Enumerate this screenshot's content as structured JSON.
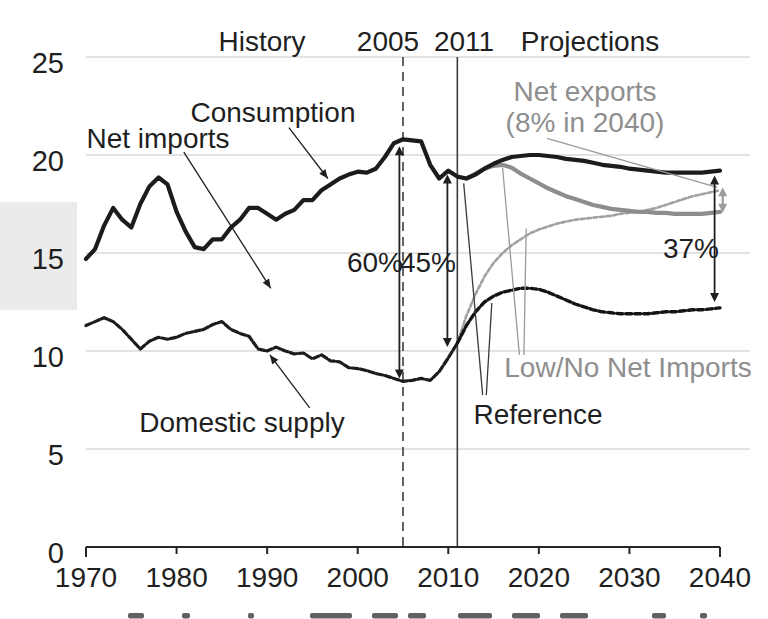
{
  "figure_labels": {
    "history": "History",
    "projections": "Projections",
    "consumption": "Consumption",
    "net_imports": "Net imports",
    "domestic_supply": "Domestic supply",
    "net_exports_line1": "Net exports",
    "net_exports_line2": "(8% in 2040)",
    "low_no_net_imports": "Low/No Net Imports",
    "reference": "Reference"
  },
  "chart_data": {
    "type": "line",
    "title": "",
    "xlabel": "",
    "ylabel": "",
    "xlim": [
      1970,
      2040
    ],
    "ylim": [
      0,
      25
    ],
    "grid": true,
    "x_ticks": [
      1970,
      1980,
      1990,
      2000,
      2010,
      2020,
      2030,
      2040
    ],
    "y_ticks": [
      0,
      5,
      10,
      15,
      20,
      25
    ],
    "colors": {
      "black_line": "#1c1c1c",
      "gray_line": "#8d8d8d",
      "gridline": "#c8c8c8",
      "gray_text": "#8e8e8e"
    },
    "series": [
      {
        "id": "domestic-supply-low-no",
        "name": "Domestic supply (Low/No Net Imports)",
        "color": "#a0a0a0",
        "width": 2.6,
        "dash": "4 2.5",
        "start_year": 2011,
        "values": [
          10.4,
          11.8,
          12.9,
          13.8,
          14.5,
          15.0,
          15.4,
          15.7,
          16.0,
          16.2,
          16.35,
          16.5,
          16.6,
          16.7,
          16.75,
          16.8,
          16.85,
          16.9,
          17.0,
          17.05,
          17.1,
          17.2,
          17.3,
          17.45,
          17.6,
          17.75,
          17.9,
          18.0,
          18.1,
          18.2
        ]
      },
      {
        "id": "domestic-supply-reference",
        "name": "Domestic supply (Reference projection)",
        "color": "#141414",
        "width": 3.4,
        "dash": "6 3",
        "start_year": 2011,
        "values": [
          10.4,
          11.3,
          12.0,
          12.5,
          12.8,
          13.0,
          13.1,
          13.2,
          13.2,
          13.15,
          13.0,
          12.8,
          12.6,
          12.4,
          12.25,
          12.1,
          12.0,
          11.95,
          11.9,
          11.9,
          11.9,
          11.9,
          11.95,
          12.0,
          12.0,
          12.05,
          12.1,
          12.1,
          12.15,
          12.2
        ]
      },
      {
        "id": "domestic-supply-history",
        "name": "Domestic supply (history)",
        "color": "#1c1c1c",
        "width": 3.2,
        "dash": "6 2.5",
        "start_year": 1970,
        "values": [
          11.3,
          11.5,
          11.7,
          11.5,
          11.1,
          10.6,
          10.1,
          10.5,
          10.7,
          10.6,
          10.7,
          10.9,
          11.0,
          11.1,
          11.35,
          11.5,
          11.1,
          10.9,
          10.75,
          10.1,
          10.0,
          10.2,
          10.0,
          9.85,
          9.9,
          9.6,
          9.8,
          9.5,
          9.45,
          9.15,
          9.1,
          9.0,
          8.85,
          8.75,
          8.6,
          8.45,
          8.5,
          8.6,
          8.5,
          8.95,
          9.65,
          10.4
        ]
      },
      {
        "id": "consumption-low-no",
        "name": "Consumption (Low/No Net Imports)",
        "color": "#8d8d8d",
        "width": 4.2,
        "dash": null,
        "start_year": 2012,
        "values": [
          18.8,
          19.05,
          19.3,
          19.45,
          19.5,
          19.35,
          19.05,
          18.8,
          18.55,
          18.3,
          18.1,
          17.9,
          17.75,
          17.6,
          17.45,
          17.35,
          17.25,
          17.2,
          17.15,
          17.1,
          17.1,
          17.05,
          17.05,
          17.0,
          17.0,
          17.0,
          17.0,
          17.05,
          17.1
        ]
      },
      {
        "id": "consumption-reference",
        "name": "Consumption (history + Reference projection)",
        "color": "#1c1c1c",
        "width": 4.2,
        "dash": null,
        "start_year": 1970,
        "values": [
          14.7,
          15.2,
          16.4,
          17.3,
          16.7,
          16.3,
          17.5,
          18.4,
          18.85,
          18.5,
          17.1,
          16.1,
          15.3,
          15.2,
          15.7,
          15.7,
          16.3,
          16.7,
          17.3,
          17.3,
          17.0,
          16.7,
          17.0,
          17.2,
          17.7,
          17.7,
          18.2,
          18.5,
          18.8,
          19.0,
          19.15,
          19.1,
          19.3,
          19.9,
          20.6,
          20.8,
          20.75,
          20.7,
          19.5,
          18.8,
          19.2,
          18.9,
          18.8,
          19.0,
          19.3,
          19.55,
          19.75,
          19.9,
          19.95,
          20.0,
          20.0,
          19.95,
          19.9,
          19.8,
          19.75,
          19.7,
          19.6,
          19.5,
          19.45,
          19.4,
          19.3,
          19.25,
          19.2,
          19.15,
          19.1,
          19.1,
          19.1,
          19.1,
          19.1,
          19.15,
          19.2
        ]
      }
    ],
    "vlines": [
      {
        "label": "2005",
        "year": 2005,
        "style": "dashed"
      },
      {
        "label": "2011",
        "year": 2011,
        "style": "solid"
      }
    ],
    "span_arrows": [
      {
        "label": "60%",
        "year": 2004.6,
        "top": 20.45,
        "bottom": 8.6,
        "color": "#1f1f1f",
        "w": 1.8
      },
      {
        "label": "45%",
        "year": 2009.9,
        "top": 19.0,
        "bottom": 10.2,
        "color": "#1f1f1f",
        "w": 1.8
      },
      {
        "label": "37%",
        "year": 2039.4,
        "top": 18.95,
        "bottom": 12.5,
        "color": "#1f1f1f",
        "w": 1.8
      },
      {
        "label": "",
        "year": 2040.3,
        "top": 18.35,
        "bottom": 17.05,
        "color": "#9c9c9c",
        "w": 2.2
      }
    ],
    "pointers": [
      {
        "id": "consumption-pointer",
        "color": "#1f1f1f",
        "head": true,
        "from": [
          1992.4,
          21.4
        ],
        "to": [
          1996.7,
          18.8
        ]
      },
      {
        "id": "net-imports-pointer",
        "color": "#1f1f1f",
        "head": true,
        "from": [
          1980.8,
          20.15
        ],
        "to": [
          1990.4,
          13.2
        ]
      },
      {
        "id": "domestic-supply-pointer",
        "color": "#1f1f1f",
        "head": true,
        "from": [
          1994.7,
          7.1
        ],
        "to": [
          1990.3,
          9.8
        ]
      },
      {
        "id": "net-exports-leader",
        "color": "#9a9a9a",
        "head": false,
        "from": [
          2020.9,
          20.85
        ],
        "to": [
          2039.7,
          18.35
        ]
      },
      {
        "id": "low-no-leader-1",
        "color": "#9a9a9a",
        "head": false,
        "from": [
          2017.85,
          9.8
        ],
        "to": [
          2016.0,
          19.35
        ]
      },
      {
        "id": "low-no-leader-2",
        "color": "#9a9a9a",
        "head": false,
        "from": [
          2018.35,
          9.8
        ],
        "to": [
          2018.6,
          16.25
        ]
      },
      {
        "id": "reference-leader-1",
        "color": "#3a3a3a",
        "head": false,
        "from": [
          2013.8,
          7.75
        ],
        "to": [
          2011.7,
          18.55
        ]
      },
      {
        "id": "reference-leader-2",
        "color": "#3a3a3a",
        "head": false,
        "from": [
          2014.2,
          7.75
        ],
        "to": [
          2014.8,
          12.45
        ]
      }
    ]
  }
}
